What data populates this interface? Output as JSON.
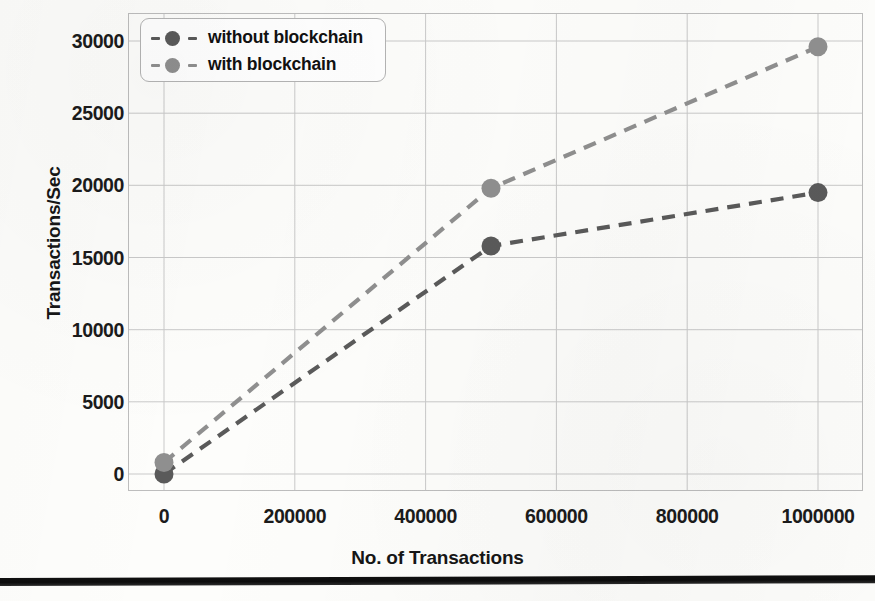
{
  "chart_data": {
    "type": "line",
    "title": "",
    "xlabel": "No. of Transactions",
    "ylabel": "Transactions/Sec",
    "xlim": [
      0,
      1000000
    ],
    "ylim": [
      0,
      30000
    ],
    "xticks": [
      "0",
      "200000",
      "400000",
      "600000",
      "800000",
      "1000000"
    ],
    "xtick_values": [
      0,
      200000,
      400000,
      600000,
      800000,
      1000000
    ],
    "yticks": [
      "0",
      "5000",
      "10000",
      "15000",
      "20000",
      "25000",
      "30000"
    ],
    "ytick_values": [
      0,
      5000,
      10000,
      15000,
      20000,
      25000,
      30000
    ],
    "grid": true,
    "legend_position": "upper left",
    "line_style": "dashed",
    "marker": "circle",
    "x": [
      0,
      500000,
      1000000
    ],
    "series": [
      {
        "name": "without blockchain",
        "values": [
          0,
          15800,
          19500
        ],
        "color": "#5a5a5a"
      },
      {
        "name": "with blockchain",
        "values": [
          800,
          19800,
          29600
        ],
        "color": "#8f8f8f"
      }
    ]
  },
  "legend": {
    "items": [
      {
        "label": "without blockchain",
        "color": "#5a5a5a"
      },
      {
        "label": "with blockchain",
        "color": "#8f8f8f"
      }
    ]
  },
  "axes": {
    "y_axis_title": "Transactions/Sec",
    "x_axis_title": "No. of Transactions"
  },
  "colors": {
    "series_without_blockchain": "#5a5a5a",
    "series_with_blockchain": "#8f8f8f",
    "grid": "#c9c9c9",
    "plot_border": "#bdbdbd",
    "text": "#161616",
    "rule": "#111111"
  }
}
